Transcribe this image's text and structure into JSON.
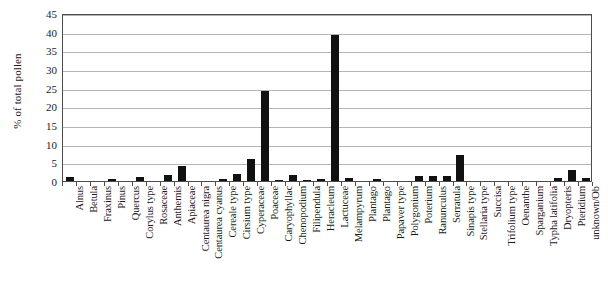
{
  "chart_data": {
    "type": "bar",
    "title": "",
    "xlabel": "",
    "ylabel": "% of total pollen",
    "ylim": [
      0,
      45
    ],
    "ytick_step": 5,
    "yticks": [
      0,
      5,
      10,
      15,
      20,
      25,
      30,
      35,
      40,
      45
    ],
    "grid": true,
    "legend": "none",
    "bar_color": "#111111",
    "categories": [
      "Alnus",
      "Betula",
      "Fraxinus",
      "Pinus",
      "Quercus",
      "Corylus type",
      "Rosaceae",
      "Anthemis",
      "Apiaceae",
      "Centaurea nigra",
      "Centaurea cyanus",
      "Cereale type",
      "Cirsium type",
      "Cyperaceae",
      "Poaceae",
      "Caryophyllac",
      "Chenopodium",
      "Filipendula",
      "Heracleum",
      "Lactuceae",
      "Melampyrum",
      "Plantago",
      "Plantago",
      "Papaver type",
      "Polygonium",
      "Poterium",
      "Ranunculus",
      "Serratula",
      "Sinapis type",
      "Stellaria type",
      "Succisa",
      "Trifolium type",
      "Oenanthe",
      "Sparganium",
      "Typha latifolia",
      "Dryopteris",
      "Pteridium",
      "unknown/Ob"
    ],
    "values": [
      1.0,
      0.0,
      0.0,
      0.5,
      0.0,
      1.2,
      0.0,
      1.5,
      4.0,
      0.0,
      0.0,
      0.6,
      1.9,
      6.0,
      24.2,
      0.3,
      1.5,
      0.4,
      0.5,
      39.0,
      0.7,
      0.0,
      0.6,
      0.0,
      0.0,
      1.4,
      1.3,
      1.3,
      7.0,
      0.0,
      0.0,
      0.0,
      0.0,
      0.0,
      0.0,
      0.8,
      3.0,
      0.7
    ]
  }
}
